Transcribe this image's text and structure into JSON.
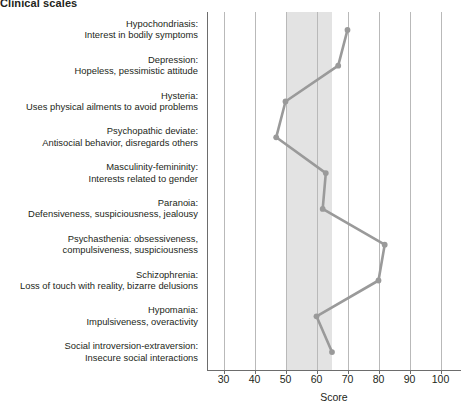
{
  "chart_title": "Clinical scales",
  "chart_data": {
    "type": "line",
    "orientation": "horizontal",
    "title": "Clinical scales",
    "xlabel": "Score",
    "ylabel": "",
    "xlim": [
      25,
      105
    ],
    "xticks": [
      30,
      40,
      50,
      60,
      70,
      80,
      90,
      100
    ],
    "xtick_labels": [
      "30",
      "40",
      "50",
      "60",
      "70",
      "80",
      "90",
      "100"
    ],
    "grid": true,
    "legend": "none",
    "normal_band": {
      "from": 50,
      "to": 65,
      "color": "#e3e3e3"
    },
    "line_color": "#9a9a9a",
    "marker": "circle",
    "categories": [
      {
        "name": "Hypochondriasis",
        "line1": "Hypochondriasis:",
        "line2": "Interest in bodily symptoms",
        "value": 70
      },
      {
        "name": "Depression",
        "line1": "Depression:",
        "line2": "Hopeless, pessimistic attitude",
        "value": 67
      },
      {
        "name": "Hysteria",
        "line1": "Hysteria:",
        "line2": "Uses physical ailments to avoid problems",
        "value": 50
      },
      {
        "name": "Psychopathic deviate",
        "line1": "Psychopathic deviate:",
        "line2": "Antisocial behavior, disregards others",
        "value": 47
      },
      {
        "name": "Masculinity-femininity",
        "line1": "Masculinity-femininity:",
        "line2": "Interests related to gender",
        "value": 63
      },
      {
        "name": "Paranoia",
        "line1": "Paranoia:",
        "line2": "Defensiveness, suspiciousness, jealousy",
        "value": 62
      },
      {
        "name": "Psychasthenia",
        "line1": "Psychasthenia: obsessiveness,",
        "line2": "compulsiveness, suspiciousness",
        "value": 82
      },
      {
        "name": "Schizophrenia",
        "line1": "Schizophrenia:",
        "line2": "Loss of touch with reality, bizarre delusions",
        "value": 80
      },
      {
        "name": "Hypomania",
        "line1": "Hypomania:",
        "line2": "Impulsiveness, overactivity",
        "value": 60
      },
      {
        "name": "Social introversion-extraversion",
        "line1": "Social introversion-extraversion:",
        "line2": "Insecure social interactions",
        "value": 65
      }
    ]
  }
}
